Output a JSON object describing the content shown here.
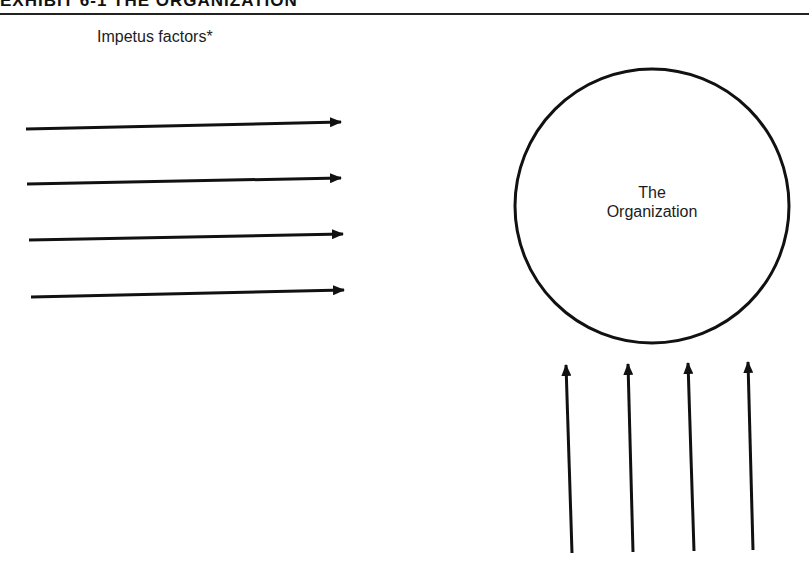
{
  "header": {
    "cropped_title": "EXHIBIT 6-1 THE ORGANIZATION"
  },
  "diagram": {
    "impetus_label": "Impetus factors*",
    "organization_label_line1": "The",
    "organization_label_line2": "Organization",
    "stroke_color": "#111111",
    "horizontal_arrows": [
      {
        "x1": 26,
        "y1": 129,
        "x2": 341,
        "y2": 122
      },
      {
        "x1": 27,
        "y1": 184,
        "x2": 341,
        "y2": 178
      },
      {
        "x1": 29,
        "y1": 240,
        "x2": 343,
        "y2": 234
      },
      {
        "x1": 31,
        "y1": 297,
        "x2": 344,
        "y2": 290
      }
    ],
    "vertical_arrows": [
      {
        "x1": 572,
        "y1": 553,
        "x2": 566,
        "y2": 365
      },
      {
        "x1": 633,
        "y1": 552,
        "x2": 628,
        "y2": 364
      },
      {
        "x1": 694,
        "y1": 551,
        "x2": 688,
        "y2": 363
      },
      {
        "x1": 753,
        "y1": 550,
        "x2": 748,
        "y2": 362
      }
    ],
    "circle": {
      "cx": 652,
      "cy": 206,
      "r": 137
    }
  }
}
